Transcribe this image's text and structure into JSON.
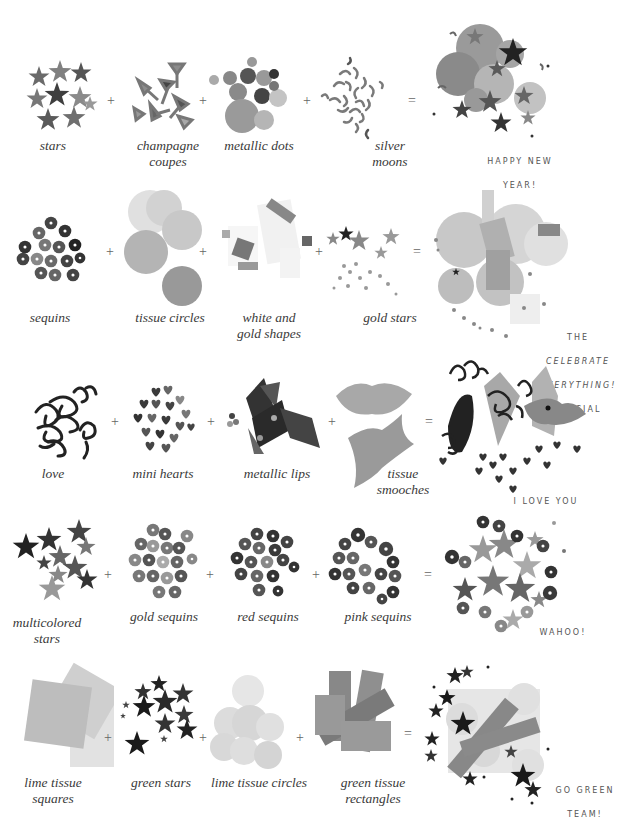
{
  "recipes": [
    {
      "ingredients": [
        {
          "label": "stars",
          "kind": "stars-dark"
        },
        {
          "label": "champagne\ncoupes",
          "kind": "coupes"
        },
        {
          "label": "metallic dots",
          "kind": "dots"
        },
        {
          "label": "silver\nmoons",
          "kind": "moons"
        }
      ],
      "operators": [
        "+",
        "+",
        "+",
        "="
      ],
      "result": {
        "line1": "HAPPY NEW",
        "line2": "YEAR!"
      }
    },
    {
      "ingredients": [
        {
          "label": "sequins",
          "kind": "sequins-dark"
        },
        {
          "label": "tissue circles",
          "kind": "tissue-circles"
        },
        {
          "label": "white and\ngold shapes",
          "kind": "shapes"
        },
        {
          "label": "gold stars",
          "kind": "gold-stars"
        }
      ],
      "operators": [
        "+",
        "+",
        "+",
        "="
      ],
      "result": {
        "line1": "THE",
        "line2": "CELEBRATE",
        "line3": "EVERYTHING!",
        "line4": "SPECIAL"
      }
    },
    {
      "ingredients": [
        {
          "label": "love",
          "kind": "love"
        },
        {
          "label": "mini hearts",
          "kind": "hearts"
        },
        {
          "label": "metallic lips",
          "kind": "lips"
        },
        {
          "label": "tissue\nsmooches",
          "kind": "smooches"
        }
      ],
      "operators": [
        "+",
        "+",
        "+",
        "="
      ],
      "result": {
        "line1": "I LOVE YOU"
      }
    },
    {
      "ingredients": [
        {
          "label": "multicolored\nstars",
          "kind": "multi-stars"
        },
        {
          "label": "gold sequins",
          "kind": "gold-sequins"
        },
        {
          "label": "red sequins",
          "kind": "red-sequins"
        },
        {
          "label": "pink sequins",
          "kind": "pink-sequins"
        }
      ],
      "operators": [
        "+",
        "+",
        "+",
        "="
      ],
      "result": {
        "line1": "WAHOO!"
      }
    },
    {
      "ingredients": [
        {
          "label": "lime tissue\nsquares",
          "kind": "squares"
        },
        {
          "label": "green stars",
          "kind": "green-stars"
        },
        {
          "label": "lime tissue circles",
          "kind": "lime-circles"
        },
        {
          "label": "green tissue\nrectangles",
          "kind": "rectangles"
        }
      ],
      "operators": [
        "+",
        "+",
        "+",
        "="
      ],
      "result": {
        "line1": "GO GREEN",
        "line2": "TEAM!"
      }
    }
  ],
  "colors": {
    "background": "#ffffff",
    "label_text": "#3a3a3a",
    "operator": "#666666",
    "result_text": "#555555"
  }
}
